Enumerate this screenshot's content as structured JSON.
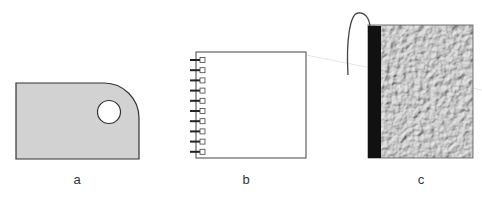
{
  "figures": [
    {
      "id": "a",
      "label": "a",
      "description": "grey tag with rounded corner and hole",
      "fill": "#d0d0d0",
      "stroke": "#333333"
    },
    {
      "id": "b",
      "label": "b",
      "description": "spiral-bound notepad",
      "fill": "#ffffff",
      "stroke": "#444444",
      "ring_count": 10
    },
    {
      "id": "c",
      "label": "c",
      "description": "textured book with black spine and string",
      "fill": "#b8b8b8",
      "spine_color": "#111111"
    }
  ]
}
